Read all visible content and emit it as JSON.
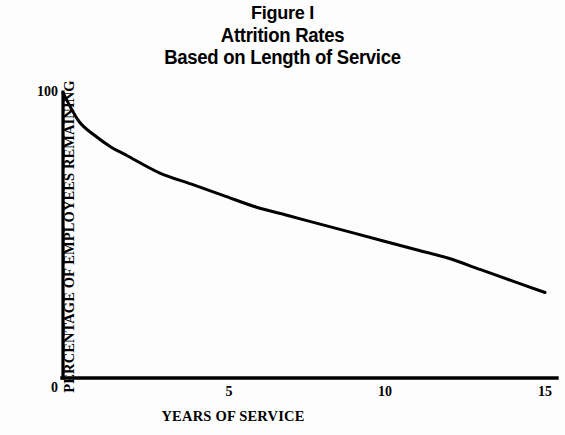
{
  "figure": {
    "title_lines": [
      "Figure I",
      "Attrition Rates",
      "Based on Length of Service"
    ]
  },
  "axes": {
    "ylabel": "PERCENTAGE OF EMPLOYEES REMAINING",
    "xlabel": "YEARS OF SERVICE",
    "y_ticks": [
      "100",
      "0"
    ],
    "x_ticks": [
      "5",
      "10",
      "15"
    ]
  },
  "colors": {
    "ink": "#000000",
    "background": "#fdfdfd"
  },
  "chart_data": {
    "type": "line",
    "title": "Figure I Attrition Rates Based on Length of Service",
    "subtitle": "Based on Length of Service",
    "xlabel": "YEARS OF SERVICE",
    "ylabel": "PERCENTAGE OF EMPLOYEES REMAINING",
    "xlim": [
      0,
      15
    ],
    "ylim": [
      0,
      100
    ],
    "xticks": [
      5,
      10,
      15
    ],
    "yticks": [
      0,
      100
    ],
    "grid": false,
    "legend": null,
    "series": [
      {
        "name": "Percentage of employees remaining",
        "x": [
          0,
          0.5,
          1,
          1.5,
          2,
          3,
          4,
          5,
          6,
          7,
          8,
          9,
          10,
          11,
          12,
          13,
          14,
          15
        ],
        "y": [
          100,
          90,
          85,
          81,
          78,
          72,
          68,
          64,
          60,
          57,
          54,
          51,
          48,
          45,
          42,
          38,
          34,
          30
        ]
      }
    ]
  }
}
